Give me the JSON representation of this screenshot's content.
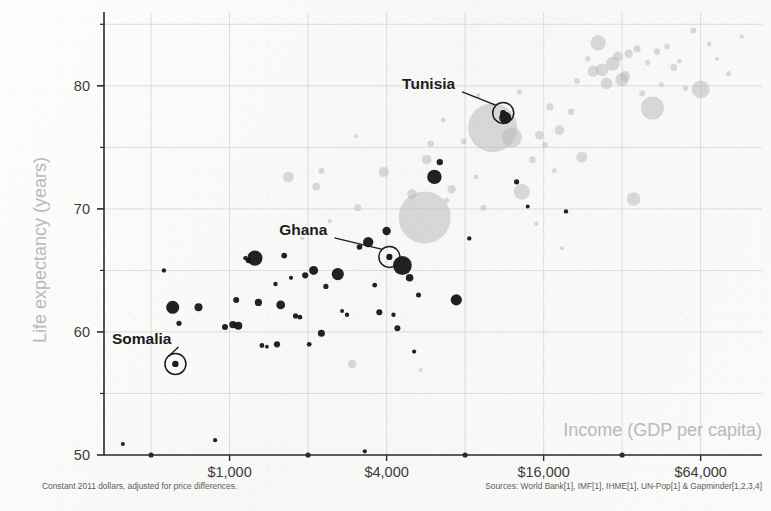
{
  "chart_data": {
    "type": "scatter",
    "title": "",
    "xlabel": "Income (GDP per capita)",
    "ylabel": "Life expectancy (years)",
    "x_scale": "log2",
    "xlim": [
      330,
      110000
    ],
    "ylim": [
      50,
      86
    ],
    "grid": true,
    "legend": false,
    "x_ticks": [
      {
        "value": 1000,
        "label": "$1,000"
      },
      {
        "value": 4000,
        "label": "$4,000"
      },
      {
        "value": 16000,
        "label": "$16,000"
      },
      {
        "value": 64000,
        "label": "$64,000"
      }
    ],
    "x_minor_ticks": [
      500,
      2000,
      8000,
      32000
    ],
    "y_ticks": [
      {
        "value": 50,
        "label": "50"
      },
      {
        "value": 60,
        "label": "60"
      },
      {
        "value": 70,
        "label": "70"
      },
      {
        "value": 80,
        "label": "80"
      }
    ],
    "y_minor_ticks": [
      55,
      65,
      75,
      85
    ],
    "footnote_left": "Constant 2011 dollars, adjusted for price differences.",
    "footnote_right": "Sources: World Bank[1], IMF[1], IHME[1], UN-Pop[1] & Gapminder[1,2,3,4]",
    "colors": {
      "background": "#fbfbfa",
      "grid": "#cfcfcf",
      "axis": "#2a2a2a",
      "tick_label": "#3c3c3c",
      "axis_title": "#b9b9b7",
      "callout": "#1c1c1c",
      "bubble_dark": "#111111",
      "bubble_light": "#b9b9b9",
      "footnote": "#5d5d5d"
    },
    "annotations": [
      {
        "name": "Somalia",
        "label": "Somalia",
        "income": 620,
        "life_expectancy": 57.4,
        "label_dx": -4,
        "label_dy": -20
      },
      {
        "name": "Ghana",
        "label": "Ghana",
        "income": 4100,
        "life_expectancy": 66.1,
        "label_dx": -62,
        "label_dy": -22
      },
      {
        "name": "Tunisia",
        "label": "Tunisia",
        "income": 11200,
        "life_expectancy": 77.8,
        "label_dx": -48,
        "label_dy": -24
      }
    ],
    "points": [
      {
        "income": 390,
        "life_expectancy": 50.9,
        "size": 2.0,
        "shade": "dark"
      },
      {
        "income": 560,
        "life_expectancy": 65.0,
        "size": 2.2,
        "shade": "dark"
      },
      {
        "income": 605,
        "life_expectancy": 62.0,
        "size": 6.5,
        "shade": "dark"
      },
      {
        "income": 620,
        "life_expectancy": 57.4,
        "size": 3.2,
        "shade": "dark"
      },
      {
        "income": 640,
        "life_expectancy": 60.7,
        "size": 2.6,
        "shade": "dark"
      },
      {
        "income": 760,
        "life_expectancy": 62.0,
        "size": 4.0,
        "shade": "dark"
      },
      {
        "income": 880,
        "life_expectancy": 51.2,
        "size": 2.1,
        "shade": "dark"
      },
      {
        "income": 960,
        "life_expectancy": 60.4,
        "size": 3.0,
        "shade": "dark"
      },
      {
        "income": 1030,
        "life_expectancy": 60.6,
        "size": 3.6,
        "shade": "dark"
      },
      {
        "income": 1080,
        "life_expectancy": 60.5,
        "size": 4.0,
        "shade": "dark"
      },
      {
        "income": 1060,
        "life_expectancy": 62.6,
        "size": 3.0,
        "shade": "dark"
      },
      {
        "income": 1150,
        "life_expectancy": 66.0,
        "size": 2.2,
        "shade": "dark"
      },
      {
        "income": 1180,
        "life_expectancy": 65.8,
        "size": 2.6,
        "shade": "dark"
      },
      {
        "income": 1250,
        "life_expectancy": 66.0,
        "size": 7.6,
        "shade": "dark"
      },
      {
        "income": 1290,
        "life_expectancy": 62.4,
        "size": 3.6,
        "shade": "dark"
      },
      {
        "income": 1330,
        "life_expectancy": 58.9,
        "size": 2.4,
        "shade": "dark"
      },
      {
        "income": 1390,
        "life_expectancy": 58.8,
        "size": 1.9,
        "shade": "dark"
      },
      {
        "income": 1500,
        "life_expectancy": 63.9,
        "size": 2.2,
        "shade": "dark"
      },
      {
        "income": 1520,
        "life_expectancy": 59.0,
        "size": 3.1,
        "shade": "dark"
      },
      {
        "income": 1570,
        "life_expectancy": 62.2,
        "size": 4.4,
        "shade": "dark"
      },
      {
        "income": 1620,
        "life_expectancy": 66.2,
        "size": 2.9,
        "shade": "dark"
      },
      {
        "income": 1680,
        "life_expectancy": 72.6,
        "size": 5.4,
        "shade": "light"
      },
      {
        "income": 1720,
        "life_expectancy": 64.4,
        "size": 2.1,
        "shade": "dark"
      },
      {
        "income": 1790,
        "life_expectancy": 61.3,
        "size": 2.6,
        "shade": "dark"
      },
      {
        "income": 1860,
        "life_expectancy": 61.2,
        "size": 2.4,
        "shade": "dark"
      },
      {
        "income": 1950,
        "life_expectancy": 64.6,
        "size": 3.1,
        "shade": "dark"
      },
      {
        "income": 2020,
        "life_expectancy": 59.0,
        "size": 2.4,
        "shade": "dark"
      },
      {
        "income": 2100,
        "life_expectancy": 65.0,
        "size": 4.5,
        "shade": "dark"
      },
      {
        "income": 2150,
        "life_expectancy": 71.8,
        "size": 4.0,
        "shade": "light"
      },
      {
        "income": 2250,
        "life_expectancy": 59.9,
        "size": 3.5,
        "shade": "dark"
      },
      {
        "income": 2340,
        "life_expectancy": 63.7,
        "size": 2.6,
        "shade": "dark"
      },
      {
        "income": 2420,
        "life_expectancy": 69.0,
        "size": 2.0,
        "shade": "light"
      },
      {
        "income": 2600,
        "life_expectancy": 64.7,
        "size": 6.1,
        "shade": "dark"
      },
      {
        "income": 2700,
        "life_expectancy": 61.7,
        "size": 2.0,
        "shade": "dark"
      },
      {
        "income": 2820,
        "life_expectancy": 61.4,
        "size": 2.2,
        "shade": "dark"
      },
      {
        "income": 2950,
        "life_expectancy": 57.4,
        "size": 4.3,
        "shade": "light"
      },
      {
        "income": 3100,
        "life_expectancy": 70.1,
        "size": 3.4,
        "shade": "light"
      },
      {
        "income": 3150,
        "life_expectancy": 66.9,
        "size": 2.8,
        "shade": "dark"
      },
      {
        "income": 3300,
        "life_expectancy": 50.3,
        "size": 2.1,
        "shade": "dark"
      },
      {
        "income": 3400,
        "life_expectancy": 67.3,
        "size": 5.2,
        "shade": "dark"
      },
      {
        "income": 3600,
        "life_expectancy": 63.8,
        "size": 2.4,
        "shade": "dark"
      },
      {
        "income": 3750,
        "life_expectancy": 61.6,
        "size": 3.0,
        "shade": "dark"
      },
      {
        "income": 3900,
        "life_expectancy": 73.0,
        "size": 5.1,
        "shade": "light"
      },
      {
        "income": 4000,
        "life_expectancy": 68.2,
        "size": 4.2,
        "shade": "dark"
      },
      {
        "income": 4100,
        "life_expectancy": 66.1,
        "size": 3.1,
        "shade": "dark"
      },
      {
        "income": 4250,
        "life_expectancy": 61.4,
        "size": 2.2,
        "shade": "dark"
      },
      {
        "income": 4400,
        "life_expectancy": 60.3,
        "size": 3.0,
        "shade": "dark"
      },
      {
        "income": 4600,
        "life_expectancy": 65.4,
        "size": 9.4,
        "shade": "dark"
      },
      {
        "income": 4900,
        "life_expectancy": 64.4,
        "size": 3.8,
        "shade": "dark"
      },
      {
        "income": 5000,
        "life_expectancy": 71.2,
        "size": 4.8,
        "shade": "light"
      },
      {
        "income": 5100,
        "life_expectancy": 58.4,
        "size": 2.1,
        "shade": "dark"
      },
      {
        "income": 5300,
        "life_expectancy": 63.0,
        "size": 2.5,
        "shade": "dark"
      },
      {
        "income": 5600,
        "life_expectancy": 69.3,
        "size": 26.0,
        "shade": "light"
      },
      {
        "income": 5700,
        "life_expectancy": 74.0,
        "size": 4.8,
        "shade": "light"
      },
      {
        "income": 5900,
        "life_expectancy": 75.3,
        "size": 3.3,
        "shade": "light"
      },
      {
        "income": 6100,
        "life_expectancy": 72.6,
        "size": 7.2,
        "shade": "dark"
      },
      {
        "income": 6400,
        "life_expectancy": 73.8,
        "size": 3.2,
        "shade": "dark"
      },
      {
        "income": 6800,
        "life_expectancy": 70.7,
        "size": 2.6,
        "shade": "light"
      },
      {
        "income": 7100,
        "life_expectancy": 71.6,
        "size": 4.2,
        "shade": "light"
      },
      {
        "income": 7400,
        "life_expectancy": 62.6,
        "size": 5.6,
        "shade": "dark"
      },
      {
        "income": 7900,
        "life_expectancy": 75.5,
        "size": 2.8,
        "shade": "light"
      },
      {
        "income": 8300,
        "life_expectancy": 67.6,
        "size": 2.2,
        "shade": "dark"
      },
      {
        "income": 8800,
        "life_expectancy": 72.6,
        "size": 2.4,
        "shade": "light"
      },
      {
        "income": 9400,
        "life_expectancy": 70.1,
        "size": 3.0,
        "shade": "light"
      },
      {
        "income": 10200,
        "life_expectancy": 76.6,
        "size": 24.5,
        "shade": "light"
      },
      {
        "income": 11200,
        "life_expectancy": 77.8,
        "size": 3.0,
        "shade": "dark"
      },
      {
        "income": 11400,
        "life_expectancy": 77.4,
        "size": 6.0,
        "shade": "dark"
      },
      {
        "income": 12100,
        "life_expectancy": 75.8,
        "size": 10.0,
        "shade": "light"
      },
      {
        "income": 12600,
        "life_expectancy": 72.2,
        "size": 2.6,
        "shade": "dark"
      },
      {
        "income": 13200,
        "life_expectancy": 71.4,
        "size": 8.0,
        "shade": "light"
      },
      {
        "income": 13900,
        "life_expectancy": 70.2,
        "size": 2.0,
        "shade": "dark"
      },
      {
        "income": 14500,
        "life_expectancy": 74.0,
        "size": 3.4,
        "shade": "light"
      },
      {
        "income": 15400,
        "life_expectancy": 76.0,
        "size": 4.4,
        "shade": "light"
      },
      {
        "income": 16200,
        "life_expectancy": 75.2,
        "size": 2.8,
        "shade": "light"
      },
      {
        "income": 16900,
        "life_expectancy": 78.3,
        "size": 3.6,
        "shade": "light"
      },
      {
        "income": 17600,
        "life_expectancy": 73.1,
        "size": 2.4,
        "shade": "light"
      },
      {
        "income": 18400,
        "life_expectancy": 76.4,
        "size": 4.8,
        "shade": "light"
      },
      {
        "income": 19500,
        "life_expectancy": 69.8,
        "size": 2.2,
        "shade": "dark"
      },
      {
        "income": 20400,
        "life_expectancy": 77.9,
        "size": 3.2,
        "shade": "light"
      },
      {
        "income": 21500,
        "life_expectancy": 80.4,
        "size": 2.8,
        "shade": "light"
      },
      {
        "income": 22400,
        "life_expectancy": 74.2,
        "size": 5.5,
        "shade": "light"
      },
      {
        "income": 23600,
        "life_expectancy": 82.2,
        "size": 2.6,
        "shade": "light"
      },
      {
        "income": 24800,
        "life_expectancy": 81.2,
        "size": 5.6,
        "shade": "light"
      },
      {
        "income": 25900,
        "life_expectancy": 83.5,
        "size": 7.6,
        "shade": "light"
      },
      {
        "income": 26800,
        "life_expectancy": 81.3,
        "size": 6.4,
        "shade": "light"
      },
      {
        "income": 27900,
        "life_expectancy": 80.2,
        "size": 5.9,
        "shade": "light"
      },
      {
        "income": 29500,
        "life_expectancy": 81.8,
        "size": 7.0,
        "shade": "light"
      },
      {
        "income": 30800,
        "life_expectancy": 82.4,
        "size": 4.8,
        "shade": "light"
      },
      {
        "income": 31900,
        "life_expectancy": 80.5,
        "size": 6.6,
        "shade": "light"
      },
      {
        "income": 32800,
        "life_expectancy": 80.8,
        "size": 5.2,
        "shade": "light"
      },
      {
        "income": 33900,
        "life_expectancy": 82.6,
        "size": 4.2,
        "shade": "light"
      },
      {
        "income": 35400,
        "life_expectancy": 70.8,
        "size": 6.8,
        "shade": "light"
      },
      {
        "income": 36500,
        "life_expectancy": 83.0,
        "size": 3.6,
        "shade": "light"
      },
      {
        "income": 38200,
        "life_expectancy": 79.4,
        "size": 3.0,
        "shade": "light"
      },
      {
        "income": 40100,
        "life_expectancy": 81.9,
        "size": 2.6,
        "shade": "light"
      },
      {
        "income": 41800,
        "life_expectancy": 78.2,
        "size": 11.5,
        "shade": "light"
      },
      {
        "income": 43500,
        "life_expectancy": 82.8,
        "size": 3.2,
        "shade": "light"
      },
      {
        "income": 45200,
        "life_expectancy": 80.1,
        "size": 2.4,
        "shade": "light"
      },
      {
        "income": 47600,
        "life_expectancy": 83.2,
        "size": 2.8,
        "shade": "light"
      },
      {
        "income": 50500,
        "life_expectancy": 81.5,
        "size": 3.4,
        "shade": "light"
      },
      {
        "income": 53000,
        "life_expectancy": 82.0,
        "size": 2.2,
        "shade": "light"
      },
      {
        "income": 56000,
        "life_expectancy": 79.8,
        "size": 2.6,
        "shade": "light"
      },
      {
        "income": 60000,
        "life_expectancy": 84.5,
        "size": 3.0,
        "shade": "light"
      },
      {
        "income": 64000,
        "life_expectancy": 79.7,
        "size": 9.0,
        "shade": "light"
      },
      {
        "income": 69000,
        "life_expectancy": 83.4,
        "size": 2.4,
        "shade": "light"
      },
      {
        "income": 74000,
        "life_expectancy": 82.2,
        "size": 2.0,
        "shade": "light"
      },
      {
        "income": 82000,
        "life_expectancy": 81.0,
        "size": 2.6,
        "shade": "light"
      },
      {
        "income": 92000,
        "life_expectancy": 84.0,
        "size": 2.2,
        "shade": "light"
      },
      {
        "income": 3050,
        "life_expectancy": 75.9,
        "size": 2.0,
        "shade": "light"
      },
      {
        "income": 2250,
        "life_expectancy": 73.1,
        "size": 3.0,
        "shade": "light"
      },
      {
        "income": 1900,
        "life_expectancy": 67.6,
        "size": 2.0,
        "shade": "light"
      },
      {
        "income": 6600,
        "life_expectancy": 77.2,
        "size": 2.4,
        "shade": "light"
      },
      {
        "income": 9000,
        "life_expectancy": 79.2,
        "size": 2.2,
        "shade": "light"
      },
      {
        "income": 12900,
        "life_expectancy": 79.5,
        "size": 2.6,
        "shade": "light"
      },
      {
        "income": 15000,
        "life_expectancy": 68.8,
        "size": 2.2,
        "shade": "light"
      },
      {
        "income": 18800,
        "life_expectancy": 66.8,
        "size": 2.0,
        "shade": "light"
      },
      {
        "income": 5400,
        "life_expectancy": 56.9,
        "size": 2.0,
        "shade": "light"
      }
    ]
  }
}
